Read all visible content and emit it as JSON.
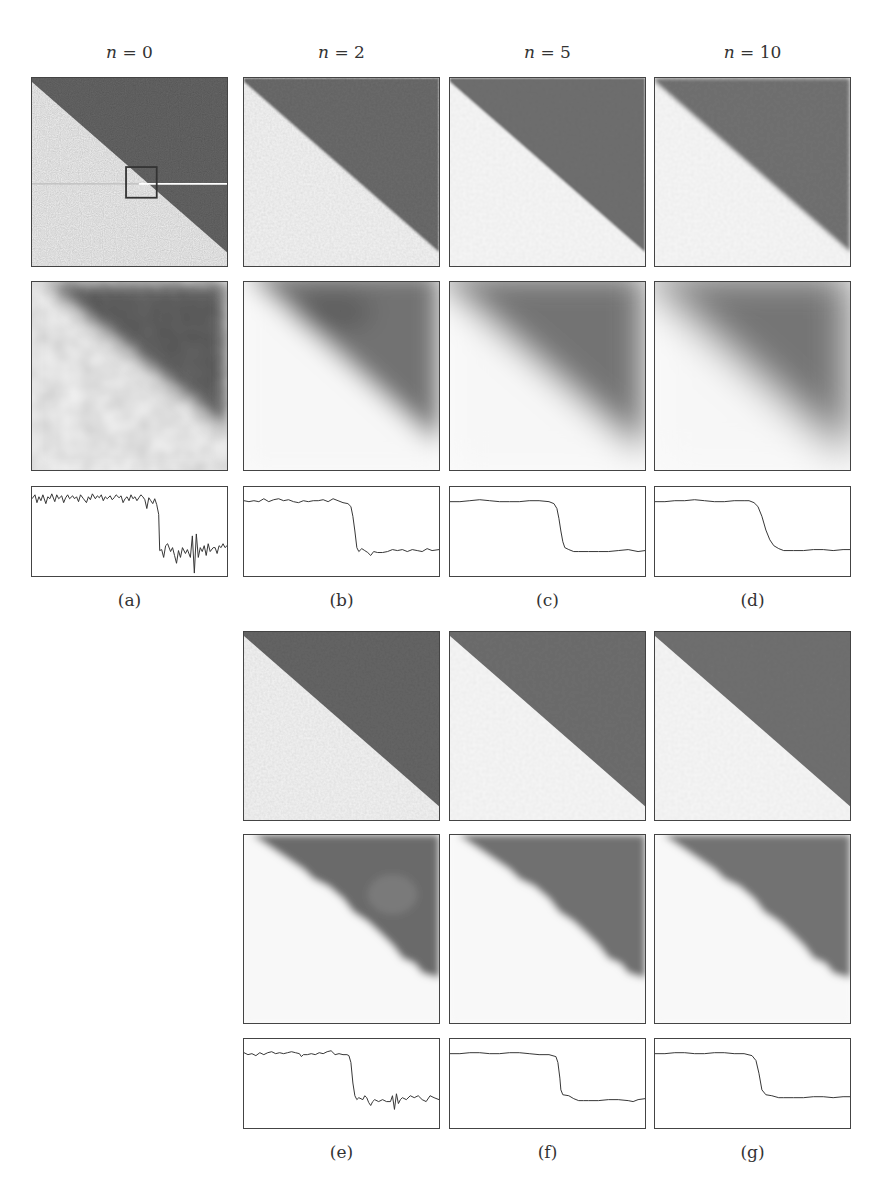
{
  "figure": {
    "column_headers": [
      {
        "label": "n = 0",
        "var": "n",
        "value": "0"
      },
      {
        "label": "n = 2",
        "var": "n",
        "value": "2"
      },
      {
        "label": "n = 5",
        "var": "n",
        "value": "5"
      },
      {
        "label": "n = 10",
        "var": "n",
        "value": "10"
      }
    ],
    "captions": {
      "a": "(a)",
      "b": "(b)",
      "c": "(c)",
      "d": "(d)",
      "e": "(e)",
      "f": "(f)",
      "g": "(g)"
    },
    "colors": {
      "dark_region": "#6f6f6f",
      "light_region": "#f7f7f7",
      "frame": "#444444",
      "profile_line": "#333333",
      "scanline_light": "#bdbdbd",
      "scanline_dark": "#ffffff"
    },
    "top_block": {
      "panels": [
        {
          "id": "a",
          "iterations": 0,
          "noise": "high",
          "blur": 0
        },
        {
          "id": "b",
          "iterations": 2,
          "noise": "medium",
          "blur": 1
        },
        {
          "id": "c",
          "iterations": 5,
          "noise": "low",
          "blur": 2
        },
        {
          "id": "d",
          "iterations": 10,
          "noise": "very low",
          "blur": 3
        }
      ]
    },
    "bottom_block": {
      "panels": [
        {
          "id": "e",
          "iterations": 2,
          "noise": "medium",
          "edge": "sharp"
        },
        {
          "id": "f",
          "iterations": 5,
          "noise": "low",
          "edge": "sharp"
        },
        {
          "id": "g",
          "iterations": 10,
          "noise": "very low",
          "edge": "sharp"
        }
      ]
    },
    "inset_box": {
      "panel": "a",
      "x_pct": 48,
      "y_pct": 47,
      "w_pct": 15,
      "h_pct": 16
    },
    "scanline": {
      "panel": "a",
      "y_pct": 56
    }
  }
}
